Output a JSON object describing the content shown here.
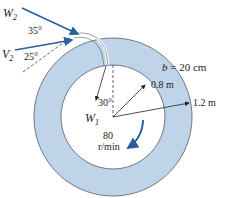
{
  "diagram": {
    "type": "centrifugal-pump-impeller",
    "labels": {
      "w2": "W",
      "w2_sub": "2",
      "v2": "V",
      "v2_sub": "2",
      "angle_35": "35°",
      "angle_25": "25°",
      "angle_30": "30°",
      "w1": "W",
      "w1_sub": "1",
      "width": "b = 20 cm",
      "inner_radius": "0.8 m",
      "outer_radius": "1.2 m",
      "speed_value": "80",
      "speed_unit": "r/min"
    },
    "colors": {
      "ring_fill": "#bfd4e8",
      "ring_stroke": "#555a66",
      "arrow_blue": "#2a5f9e",
      "text": "#222222"
    }
  }
}
